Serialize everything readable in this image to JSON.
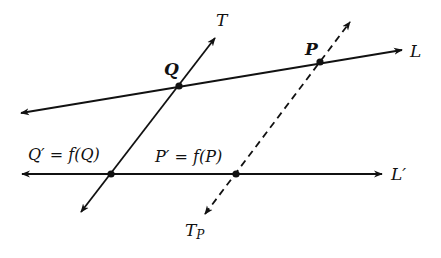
{
  "diagram": {
    "title": "",
    "colors": {
      "ink": "#111111",
      "background": "#ffffff"
    },
    "lines": {
      "L": {
        "label": "L",
        "from": [
          21,
          113
        ],
        "to": [
          402,
          50
        ],
        "style": "solid",
        "arrows": "both"
      },
      "L_prime": {
        "label": "L′",
        "from": [
          22,
          174
        ],
        "to": [
          382,
          174
        ],
        "style": "solid",
        "arrows": "both"
      },
      "T": {
        "label": "T",
        "from": [
          81,
          212
        ],
        "to": [
          215,
          38
        ],
        "style": "solid",
        "arrows": "both"
      },
      "T_P": {
        "label": "T",
        "label_sub": "P",
        "from": [
          205,
          214
        ],
        "to": [
          350,
          22
        ],
        "style": "dashed",
        "arrows": "both"
      }
    },
    "points": {
      "Q": {
        "label": "Q",
        "at": [
          179,
          86
        ]
      },
      "P": {
        "label": "P",
        "at": [
          320,
          62
        ]
      },
      "Q_prime": {
        "label": "Q′ = f(Q)",
        "at": [
          111,
          174
        ]
      },
      "P_prime": {
        "label": "P′ = f(P)",
        "at": [
          236,
          174
        ]
      }
    }
  }
}
